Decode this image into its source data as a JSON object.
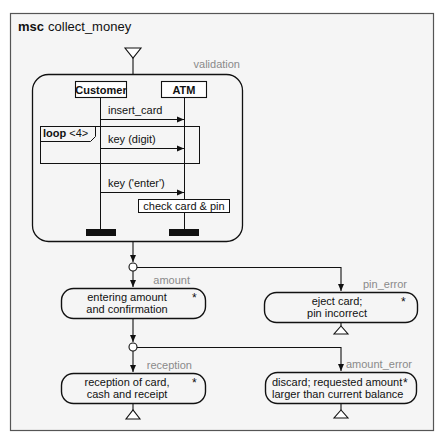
{
  "diagram": {
    "keyword": "msc",
    "name": "collect_money",
    "colors": {
      "frame": "#555555",
      "background": "#f5f5f5",
      "stroke": "#111111",
      "label_gray": "#8a8a8a"
    },
    "validation": {
      "label": "validation",
      "instances": [
        {
          "name": "Customer"
        },
        {
          "name": "ATM"
        }
      ],
      "messages": [
        {
          "label": "insert_card",
          "from": "Customer",
          "to": "ATM"
        },
        {
          "label": "key (digit)",
          "from": "Customer",
          "to": "ATM"
        },
        {
          "label": "key ('enter')",
          "from": "Customer",
          "to": "ATM"
        }
      ],
      "loop": {
        "keyword": "loop",
        "count": "<4>"
      },
      "action": "check card & pin"
    },
    "states": {
      "amount": {
        "label": "amount",
        "line1": "entering amount",
        "line2": "and confirmation",
        "marker": "*"
      },
      "pin_error": {
        "label": "pin_error",
        "line1": "eject card;",
        "line2": "pin incorrect",
        "marker": "*"
      },
      "reception": {
        "label": "reception",
        "line1": "reception of card,",
        "line2": "cash and receipt",
        "marker": "*"
      },
      "amount_error": {
        "label": "amount_error",
        "line1": "discard; requested amount",
        "line2": "larger than current balance",
        "marker": "*"
      }
    }
  }
}
